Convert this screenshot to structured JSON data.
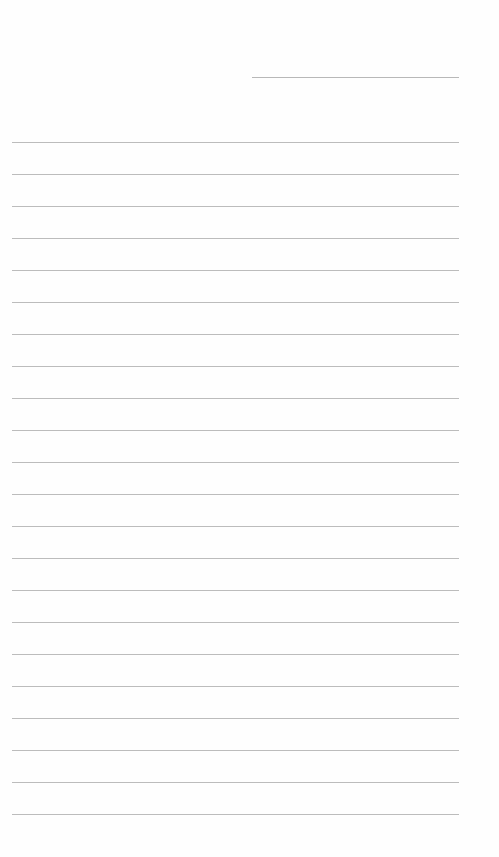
{
  "document": {
    "type": "lined-paper",
    "background_color": "#fefefe",
    "line_color": "#bcbcbc",
    "header_line": {
      "x": 252,
      "y": 77,
      "width": 207
    },
    "ruled_lines": {
      "count": 22,
      "first_y": 142,
      "spacing": 32,
      "x": 12,
      "width": 447
    }
  }
}
